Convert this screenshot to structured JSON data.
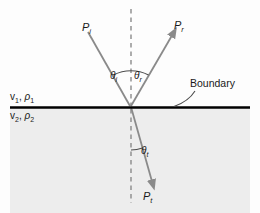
{
  "figure": {
    "type": "wave-reflection-refraction-diagram",
    "width": 260,
    "height": 213,
    "background_upper": "#fdfdfd",
    "background_lower": "#eeeeee",
    "ray_color": "#8a8a8a",
    "boundary_color": "#000000",
    "normal_color": "#8a8a8a",
    "text_color": "#1a1a1a"
  },
  "rays": {
    "incident": {
      "label_p": "P",
      "label_sub": "i"
    },
    "reflected": {
      "label_p": "P",
      "label_sub": "r"
    },
    "transmitted": {
      "label_p": "P",
      "label_sub": "t"
    }
  },
  "angles": {
    "incident": {
      "symbol": "θ",
      "sub": "i"
    },
    "reflected": {
      "symbol": "θ",
      "sub": "r"
    },
    "transmitted": {
      "symbol": "θ",
      "sub": "t"
    }
  },
  "media": {
    "upper": {
      "velocity": "v",
      "velocity_sub": "1",
      "separator": ", ",
      "density": "ρ",
      "density_sub": "1"
    },
    "lower": {
      "velocity": "v",
      "velocity_sub": "2",
      "separator": ", ",
      "density": "ρ",
      "density_sub": "2"
    }
  },
  "annotations": {
    "boundary": "Boundary"
  }
}
